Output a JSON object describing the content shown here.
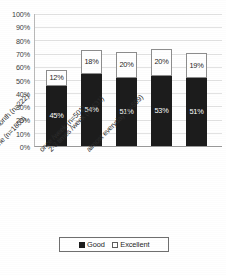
{
  "chart_data": {
    "type": "bar",
    "subtype": "stacked-bar",
    "title": "",
    "xlabel": "",
    "ylabel": "",
    "ylim": [
      0,
      100
    ],
    "y_ticks": [
      "0%",
      "10%",
      "20%",
      "30%",
      "40%",
      "50%",
      "60%",
      "70%",
      "80%",
      "90%",
      "100%"
    ],
    "grid": true,
    "legend_position": "bottom",
    "categories": [
      "None (n=1803)",
      "1-2 times /month (n=222)",
      "once /week (n=501)",
      "2-3 times /week (n=631)",
      "almost everyday (n=599)"
    ],
    "series": [
      {
        "name": "Good",
        "color": "#1c1c1c",
        "values": [
          45,
          54,
          51,
          53,
          51
        ],
        "labels": [
          "45%",
          "54%",
          "51%",
          "53%",
          "51%"
        ]
      },
      {
        "name": "Excellent",
        "color": "#ffffff",
        "values": [
          12,
          18,
          20,
          20,
          19
        ],
        "labels": [
          "12%",
          "18%",
          "20%",
          "20%",
          "19%"
        ]
      }
    ],
    "totals": [
      57,
      72,
      71,
      73,
      70
    ]
  },
  "legend": {
    "items": [
      {
        "label": "Good",
        "swatch": "filled-square-icon"
      },
      {
        "label": "Excellent",
        "swatch": "outlined-square-icon"
      }
    ]
  }
}
